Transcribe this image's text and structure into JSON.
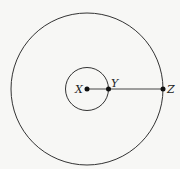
{
  "diagram": {
    "type": "concentric-circles",
    "center": {
      "label": "X",
      "x": 87,
      "y": 89
    },
    "inner_circle": {
      "radius": 22
    },
    "outer_circle": {
      "radius": 76
    },
    "points": [
      {
        "label": "X",
        "x": 87,
        "y": 89
      },
      {
        "label": "Y",
        "x": 108,
        "y": 89
      },
      {
        "label": "Z",
        "x": 163,
        "y": 89
      }
    ],
    "segment": {
      "from": "X",
      "to": "Z"
    },
    "colors": {
      "stroke": "#333333",
      "background": "#f7f7f5"
    }
  }
}
